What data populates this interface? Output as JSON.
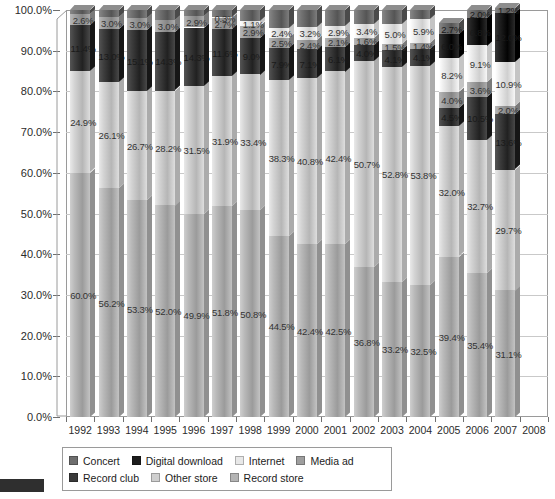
{
  "chart_data": {
    "type": "bar",
    "subtype": "stacked-100-percent",
    "title": "",
    "xlabel": "",
    "ylabel": "",
    "ylim": [
      0,
      100
    ],
    "ytick_labels": [
      "0.0%",
      "10.0%",
      "20.0%",
      "30.0%",
      "40.0%",
      "50.0%",
      "60.0%",
      "70.0%",
      "80.0%",
      "90.0%",
      "100.0%"
    ],
    "ytick_values": [
      0,
      10,
      20,
      30,
      40,
      50,
      60,
      70,
      80,
      90,
      100
    ],
    "grid": true,
    "legend_position": "bottom",
    "categories": [
      "1992",
      "1993",
      "1994",
      "1995",
      "1996",
      "1997",
      "1998",
      "1999",
      "2000",
      "2001",
      "2002",
      "2003",
      "2004",
      "2005",
      "2006",
      "2007"
    ],
    "axis_tick_labels": [
      "1992",
      "1993",
      "1994",
      "1995",
      "1996",
      "1997",
      "1998",
      "1999",
      "2000",
      "2001",
      "2002",
      "2003",
      "2004",
      "2005",
      "2006",
      "2007",
      "2008"
    ],
    "stack_order_bottom_to_top": [
      "Record store",
      "Other store",
      "Record club",
      "Media ad",
      "Internet",
      "Digital download",
      "Concert"
    ],
    "series": [
      {
        "name": "Record store",
        "color": "#b4b4b4",
        "values": [
          60.0,
          56.2,
          53.3,
          52.0,
          49.9,
          51.8,
          50.8,
          44.5,
          42.4,
          42.5,
          36.8,
          33.2,
          32.5,
          39.4,
          35.4,
          31.1
        ],
        "labels": [
          "60.0%",
          "56.2%",
          "53.3%",
          "52.0%",
          "49.9%",
          "51.8%",
          "50.8%",
          "44.5%",
          "42.4%",
          "42.5%",
          "36.8%",
          "33.2%",
          "32.5%",
          "39.4%",
          "35.4%",
          "31.1%"
        ]
      },
      {
        "name": "Other store",
        "color": "#cfcfcf",
        "values": [
          24.9,
          26.1,
          26.7,
          28.2,
          31.5,
          31.9,
          33.4,
          38.3,
          40.8,
          42.4,
          50.7,
          52.8,
          53.8,
          32.0,
          32.7,
          29.7
        ],
        "labels": [
          "24.9%",
          "26.1%",
          "26.7%",
          "28.2%",
          "31.5%",
          "31.9%",
          "33.4%",
          "38.3%",
          "40.8%",
          "42.4%",
          "50.7%",
          "52.8%",
          "53.8%",
          "32.0%",
          "32.7%",
          "29.7%"
        ]
      },
      {
        "name": "Record club",
        "color": "#3a3a3a",
        "values": [
          11.4,
          13.0,
          15.1,
          14.3,
          14.3,
          11.6,
          9.0,
          7.9,
          7.1,
          6.1,
          4.0,
          4.1,
          4.1,
          4.5,
          10.5,
          13.6
        ],
        "labels": [
          "11.4%",
          "13.0%",
          "15.1%",
          "14.3%",
          "14.3%",
          "11.6%",
          "9.0%",
          "7.9%",
          "7.1%",
          "6.1%",
          "4.0%",
          "4.1%",
          "4.1%",
          "4.5%",
          "10.5%",
          "13.6%"
        ]
      },
      {
        "name": "Media ad",
        "color": "#9e9e9e",
        "values": [
          2.6,
          3.0,
          3.0,
          3.0,
          2.9,
          2.7,
          2.9,
          2.5,
          2.4,
          2.1,
          1.6,
          1.5,
          1.4,
          4.0,
          3.6,
          2.0
        ],
        "labels": [
          "2.6%",
          "3.0%",
          "3.0%",
          "3.0%",
          "2.9%",
          "2.7%",
          "2.9%",
          "2.5%",
          "2.4%",
          "2.1%",
          "1.6%",
          "1.5%",
          "1.4%",
          "4.0%",
          "3.6%",
          "2.0%"
        ]
      },
      {
        "name": "Internet",
        "color": "#e8e8e8",
        "values": [
          0.0,
          0.0,
          0.0,
          0.0,
          0.0,
          0.3,
          1.1,
          2.4,
          3.2,
          2.9,
          3.4,
          5.0,
          5.9,
          8.2,
          9.1,
          10.9
        ],
        "labels": [
          "",
          "",
          "",
          "",
          "",
          "0.3%",
          "1.1%",
          "2.4%",
          "3.2%",
          "2.9%",
          "3.4%",
          "5.0%",
          "5.9%",
          "8.2%",
          "9.1%",
          "10.9%"
        ]
      },
      {
        "name": "Digital download",
        "color": "#1c1c1c",
        "values": [
          0.0,
          0.0,
          0.0,
          0.0,
          0.0,
          0.0,
          0.0,
          0.0,
          0.0,
          0.0,
          0.0,
          0.0,
          0.0,
          6.0,
          6.8,
          12.0
        ],
        "labels": [
          "",
          "",
          "",
          "",
          "",
          "",
          "",
          "",
          "",
          "",
          "",
          "",
          "",
          "6.0%",
          "6.8%",
          "12.0%"
        ]
      },
      {
        "name": "Concert",
        "color": "#6e6e6e",
        "values": [
          1.1,
          1.7,
          1.9,
          2.5,
          1.4,
          1.7,
          2.8,
          4.4,
          4.1,
          4.0,
          3.5,
          3.4,
          2.3,
          2.7,
          2.0,
          1.2
        ],
        "labels": [
          "",
          "",
          "",
          "",
          "",
          "",
          "",
          "",
          "",
          "",
          "",
          "",
          "",
          "2.7%",
          "2.0%",
          "1.2%"
        ]
      }
    ]
  },
  "legend": {
    "row1": [
      {
        "label": "Concert",
        "color": "#6e6e6e"
      },
      {
        "label": "Digital download",
        "color": "#1c1c1c"
      },
      {
        "label": "Internet",
        "color": "#e8e8e8"
      },
      {
        "label": "Media ad",
        "color": "#9e9e9e"
      }
    ],
    "row2": [
      {
        "label": "Record club",
        "color": "#3a3a3a"
      },
      {
        "label": "Other store",
        "color": "#cfcfcf"
      },
      {
        "label": "Record store",
        "color": "#b4b4b4"
      }
    ]
  }
}
